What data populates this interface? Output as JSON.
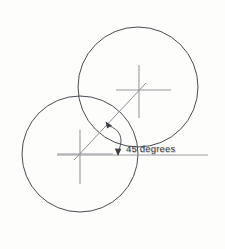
{
  "drawing": {
    "title": "45 degrees angle construction between two circle centers",
    "background_color": "#fdfdfc",
    "line_color": "#4a4a50",
    "construction_line_color": "#9a9a9f",
    "text_color": "#3d3d42",
    "annotations": {
      "angle_label": "45 degrees",
      "angle_value": 45,
      "angle_units": "degrees"
    },
    "circles": [
      {
        "name": "upper-right-circle",
        "cx": 138,
        "cy": 87,
        "r": 60,
        "stroke": "#4a4a50"
      },
      {
        "name": "lower-left-circle",
        "cx": 80,
        "cy": 154,
        "r": 58,
        "stroke": "#4a4a50"
      }
    ],
    "center_marks": [
      {
        "name": "upper-circle-center-mark",
        "cx": 139,
        "cy": 90,
        "h_x1": 116,
        "h_x2": 171,
        "v_y1": 65,
        "v_y2": 118
      },
      {
        "name": "lower-circle-center-mark",
        "cx": 80,
        "cy": 154,
        "h_x1": 57,
        "h_x2": 113,
        "v_y1": 130,
        "v_y2": 184
      }
    ],
    "reference_line": {
      "name": "horizontal-datum-line",
      "x1": 57,
      "y1": 155,
      "x2": 208,
      "y2": 155
    },
    "angle_line": {
      "name": "forty-five-degree-line",
      "x1": 74,
      "y1": 160,
      "x2": 146,
      "y2": 83
    },
    "angle_arc": {
      "name": "angle-dimension-arc",
      "center_x": 80,
      "center_y": 154,
      "radius": 40,
      "start_angle_deg": 45,
      "end_angle_deg": 2
    },
    "arrowheads": [
      {
        "name": "arc-arrowhead-upper",
        "x": 107,
        "y": 123,
        "direction": "up-left"
      },
      {
        "name": "arc-arrowhead-lower",
        "x": 118,
        "y": 152,
        "direction": "down"
      }
    ],
    "label_position": {
      "x": 126,
      "y": 152
    }
  }
}
